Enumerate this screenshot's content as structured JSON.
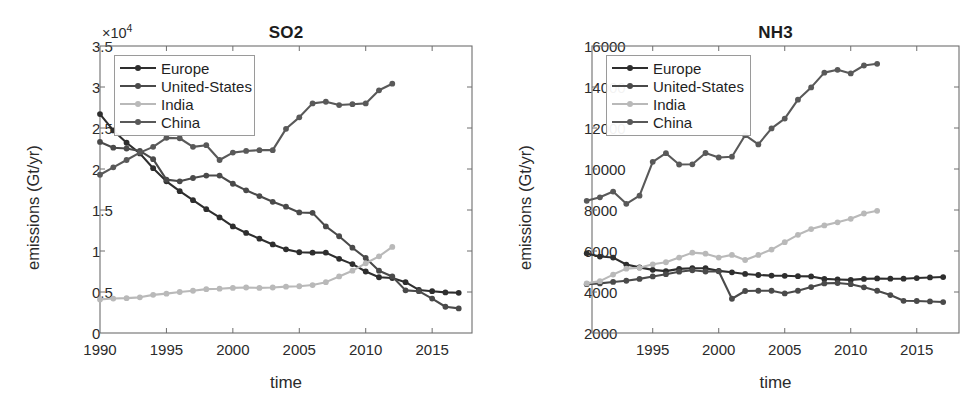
{
  "figure": {
    "width": 969,
    "height": 411,
    "background": "#ffffff"
  },
  "series_style": {
    "Europe": "#2e2e2e",
    "United-States": "#4a4a4a",
    "India": "#b9b9b9",
    "China": "#595959"
  },
  "panels": [
    {
      "id": "so2",
      "title": "SO2",
      "xlabel": "time",
      "ylabel": "emissions (Gt/yr)",
      "y_multiplier": "×10",
      "y_multiplier_exp": "4",
      "yticks": [
        "0",
        "0.5",
        "1",
        "1.5",
        "2",
        "2.5",
        "3",
        "3.5"
      ],
      "xticks": [
        "1990",
        "1995",
        "2000",
        "2005",
        "2010",
        "2015"
      ],
      "legend": [
        "Europe",
        "United-States",
        "India",
        "China"
      ]
    },
    {
      "id": "nh3",
      "title": "NH3",
      "xlabel": "time",
      "ylabel": "emissions (Gt/yr)",
      "y_multiplier": "",
      "y_multiplier_exp": "",
      "yticks": [
        "2000",
        "4000",
        "6000",
        "8000",
        "10000",
        "12000",
        "14000",
        "16000"
      ],
      "xticks": [
        "1995",
        "2000",
        "2005",
        "2010",
        "2015"
      ],
      "legend": [
        "Europe",
        "United-States",
        "India",
        "China"
      ]
    }
  ],
  "chart_data": [
    {
      "type": "line",
      "title": "SO2",
      "xlabel": "time",
      "ylabel": "emissions (Gt/yr)",
      "y_axis_multiplier": 10000,
      "xlim": [
        1990,
        2018
      ],
      "ylim": [
        0,
        35000
      ],
      "ytick_values": [
        0,
        5000,
        10000,
        15000,
        20000,
        25000,
        30000,
        35000
      ],
      "xtick_values": [
        1990,
        1995,
        2000,
        2005,
        2010,
        2015
      ],
      "grid": false,
      "legend_position": "upper-left",
      "series": [
        {
          "name": "Europe",
          "color": "#2e2e2e",
          "x": [
            1990,
            1991,
            1992,
            1993,
            1994,
            1995,
            1996,
            1997,
            1998,
            1999,
            2000,
            2001,
            2002,
            2003,
            2004,
            2005,
            2006,
            2007,
            2008,
            2009,
            2010,
            2011,
            2012,
            2013,
            2014,
            2015,
            2016,
            2017
          ],
          "values": [
            26700,
            24700,
            23200,
            21900,
            20100,
            18500,
            17300,
            16200,
            15100,
            14100,
            13000,
            12200,
            11500,
            10800,
            10200,
            9850,
            9800,
            9800,
            9050,
            8400,
            7500,
            6800,
            6700,
            6200,
            5250,
            5100,
            4950,
            4900
          ]
        },
        {
          "name": "United-States",
          "color": "#4a4a4a",
          "x": [
            1990,
            1991,
            1992,
            1993,
            1994,
            1995,
            1996,
            1997,
            1998,
            1999,
            2000,
            2001,
            2002,
            2003,
            2004,
            2005,
            2006,
            2007,
            2008,
            2009,
            2010,
            2011,
            2012,
            2013,
            2014,
            2015,
            2016,
            2017
          ],
          "values": [
            23300,
            22600,
            22500,
            22200,
            21200,
            18700,
            18500,
            18900,
            19200,
            19200,
            18200,
            17400,
            16700,
            16000,
            15400,
            14700,
            14650,
            13000,
            11800,
            10400,
            9150,
            7600,
            6900,
            5200,
            5100,
            4200,
            3200,
            3000
          ]
        },
        {
          "name": "India",
          "color": "#b9b9b9",
          "x": [
            1990,
            1991,
            1992,
            1993,
            1994,
            1995,
            1996,
            1997,
            1998,
            1999,
            2000,
            2001,
            2002,
            2003,
            2004,
            2005,
            2006,
            2007,
            2008,
            2009,
            2010,
            2011,
            2012
          ],
          "values": [
            4100,
            4200,
            4250,
            4350,
            4650,
            4800,
            5000,
            5150,
            5350,
            5400,
            5500,
            5550,
            5500,
            5550,
            5650,
            5700,
            5850,
            6200,
            6900,
            7600,
            8500,
            9350,
            10500
          ]
        },
        {
          "name": "China",
          "color": "#595959",
          "x": [
            1990,
            1991,
            1992,
            1993,
            1994,
            1995,
            1996,
            1997,
            1998,
            1999,
            2000,
            2001,
            2002,
            2003,
            2004,
            2005,
            2006,
            2007,
            2008,
            2009,
            2010,
            2011,
            2012
          ],
          "values": [
            19300,
            20200,
            21100,
            22000,
            22700,
            23800,
            23750,
            22700,
            22900,
            21100,
            22000,
            22200,
            22300,
            22300,
            24900,
            26300,
            28000,
            28200,
            27800,
            27900,
            28000,
            29600,
            30400
          ]
        }
      ]
    },
    {
      "type": "line",
      "title": "NH3",
      "xlabel": "time",
      "ylabel": "emissions (Gt/yr)",
      "y_axis_multiplier": 1,
      "xlim": [
        1990.4,
        2018.2
      ],
      "ylim": [
        2000,
        16000
      ],
      "ytick_values": [
        2000,
        4000,
        6000,
        8000,
        10000,
        12000,
        14000,
        16000
      ],
      "xtick_values": [
        1995,
        2000,
        2005,
        2010,
        2015
      ],
      "grid": false,
      "legend_position": "upper-left",
      "series": [
        {
          "name": "Europe",
          "color": "#2e2e2e",
          "x": [
            1990,
            1991,
            1992,
            1993,
            1994,
            1995,
            1996,
            1997,
            1998,
            1999,
            2000,
            2001,
            2002,
            2003,
            2004,
            2005,
            2006,
            2007,
            2008,
            2009,
            2010,
            2011,
            2012,
            2013,
            2014,
            2015,
            2016,
            2017
          ],
          "values": [
            5880,
            5730,
            5680,
            5340,
            5200,
            5080,
            5020,
            5130,
            5160,
            5160,
            5030,
            4960,
            4880,
            4830,
            4800,
            4790,
            4770,
            4760,
            4640,
            4610,
            4590,
            4640,
            4660,
            4650,
            4650,
            4680,
            4710,
            4730
          ]
        },
        {
          "name": "United-States",
          "color": "#4a4a4a",
          "x": [
            1990,
            1991,
            1992,
            1993,
            1994,
            1995,
            1996,
            1997,
            1998,
            1999,
            2000,
            2001,
            2002,
            2003,
            2004,
            2005,
            2006,
            2007,
            2008,
            2009,
            2010,
            2011,
            2012,
            2013,
            2014,
            2015,
            2016,
            2017
          ],
          "values": [
            4380,
            4420,
            4490,
            4550,
            4640,
            4760,
            4870,
            4990,
            5060,
            5000,
            5010,
            3670,
            4050,
            4060,
            4060,
            3930,
            4060,
            4240,
            4420,
            4440,
            4380,
            4230,
            4060,
            3850,
            3570,
            3560,
            3540,
            3510
          ]
        },
        {
          "name": "India",
          "color": "#b9b9b9",
          "x": [
            1990,
            1991,
            1992,
            1993,
            1994,
            1995,
            1996,
            1997,
            1998,
            1999,
            2000,
            2001,
            2002,
            2003,
            2004,
            2005,
            2006,
            2007,
            2008,
            2009,
            2010,
            2011,
            2012
          ],
          "values": [
            4420,
            4530,
            4850,
            5140,
            5180,
            5350,
            5450,
            5680,
            5920,
            5870,
            5680,
            5810,
            5560,
            5810,
            6070,
            6430,
            6790,
            7070,
            7250,
            7400,
            7570,
            7830,
            7960
          ]
        },
        {
          "name": "China",
          "color": "#595959",
          "x": [
            1990,
            1991,
            1992,
            1993,
            1994,
            1995,
            1996,
            1997,
            1998,
            1999,
            2000,
            2001,
            2002,
            2003,
            2004,
            2005,
            2006,
            2007,
            2008,
            2009,
            2010,
            2011,
            2012
          ],
          "values": [
            8450,
            8620,
            8900,
            8300,
            8700,
            10350,
            10770,
            10220,
            10230,
            10780,
            10560,
            10600,
            11650,
            11200,
            11980,
            12460,
            13380,
            13980,
            14700,
            14840,
            14660,
            15050,
            15130
          ]
        }
      ]
    }
  ]
}
